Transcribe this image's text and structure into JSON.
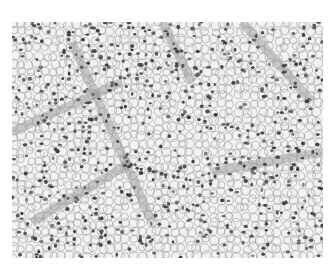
{
  "image": {
    "subject": "grayscale histology micrograph of clear cells with scattered dark nuclei and fibrovascular septa",
    "colors": {
      "background": "#ffffff",
      "cytoplasm": "#f2f2f2",
      "membrane": "#9a9a9a",
      "nucleus": "#3a3a3a",
      "septa": "#7a7a7a"
    }
  }
}
